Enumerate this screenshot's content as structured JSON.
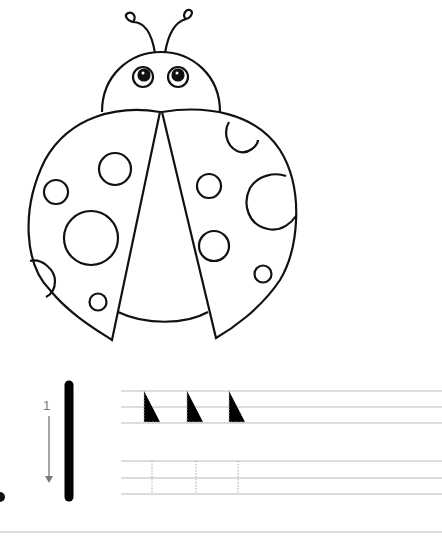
{
  "worksheet": {
    "illustration": "ladybug-coloring-outline",
    "letter": "l",
    "stroke_order": {
      "number": "1",
      "direction": "down"
    },
    "tracing_rows": [
      {
        "guide_letters": [
          "l",
          "l",
          "l"
        ]
      },
      {
        "guide_letters": [
          "l",
          "l",
          "l"
        ]
      }
    ],
    "colors": {
      "outline": "#111111",
      "guide_line": "#bbbbbb",
      "arrow": "#777777",
      "model_letter": "#000000"
    }
  }
}
